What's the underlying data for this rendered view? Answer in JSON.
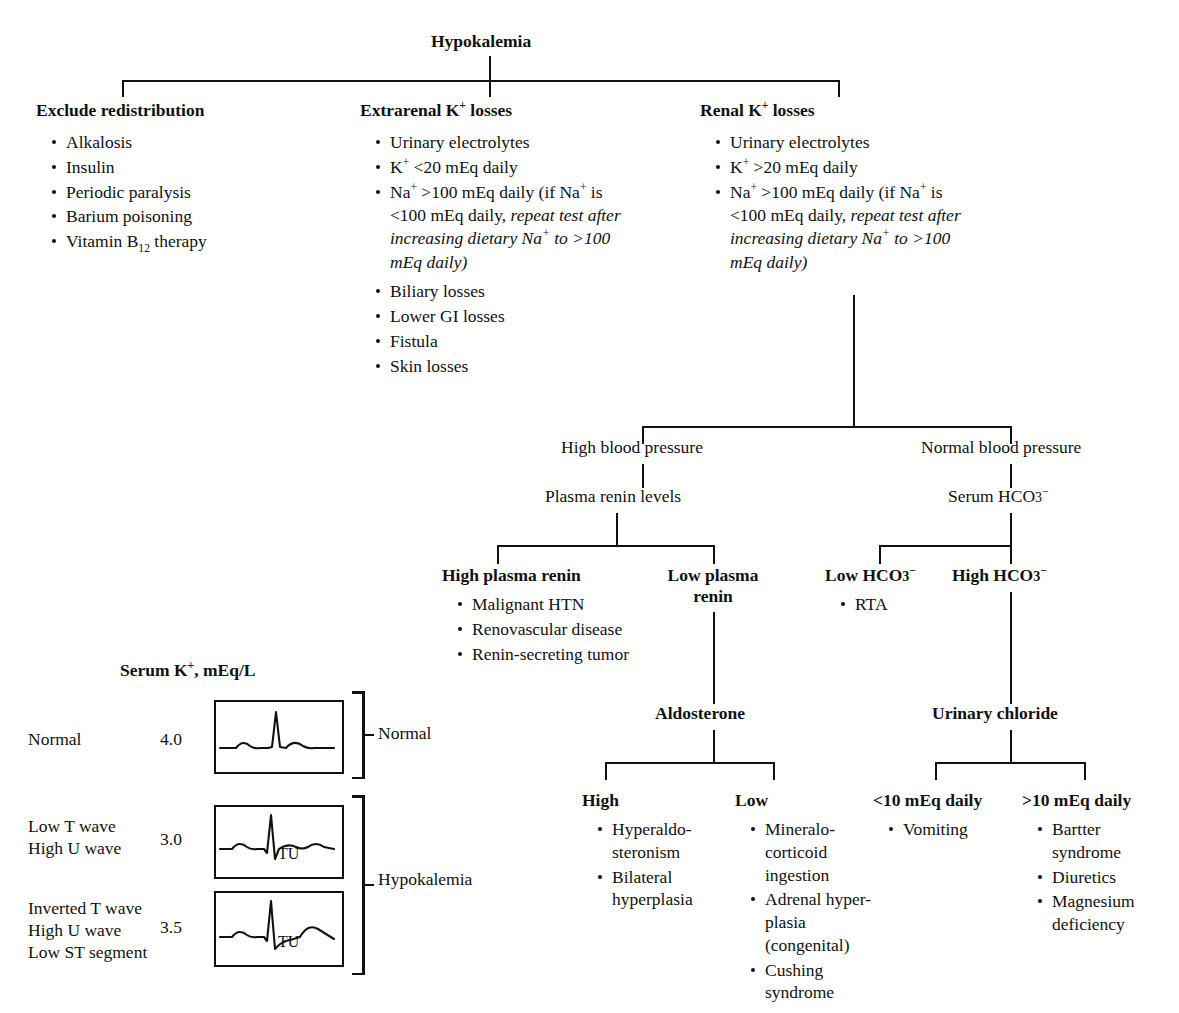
{
  "diagram": {
    "type": "clinical-decision-tree",
    "title": "Hypokalemia",
    "root": {
      "label": "Hypokalemia"
    },
    "level1": [
      {
        "id": "exclude-redistribution",
        "heading": "Exclude redistribution",
        "bullets": [
          "Alkalosis",
          "Insulin",
          "Periodic paralysis",
          "Barium poisoning",
          "Vitamin B12 therapy"
        ]
      },
      {
        "id": "extrarenal-k-losses",
        "heading": "Extrarenal K+ losses",
        "bullets": [
          "Urinary electrolytes",
          "K+ <20 mEq daily",
          "Na+ >100 mEq daily (if Na+ is <100 mEq daily, repeat test after increasing dietary Na+ to >100 mEq daily)",
          "Biliary losses",
          "Lower GI losses",
          "Fistula",
          "Skin losses"
        ]
      },
      {
        "id": "renal-k-losses",
        "heading": "Renal K+ losses",
        "bullets": [
          "Urinary electrolytes",
          "K+ >20 mEq daily",
          "Na+ >100 mEq daily (if Na+ is <100 mEq daily, repeat test after increasing dietary Na+ to >100 mEq daily)"
        ]
      }
    ],
    "branches": {
      "blood_pressure": {
        "high": "High blood pressure",
        "normal": "Normal blood pressure"
      },
      "plasma_renin_levels": "Plasma renin levels",
      "serum_hco3": "Serum HCO3-",
      "renin": {
        "high": {
          "heading": "High plasma renin",
          "bullets": [
            "Malignant HTN",
            "Renovascular disease",
            "Renin-secreting tumor"
          ]
        },
        "low": {
          "heading": "Low plasma renin"
        }
      },
      "hco3": {
        "low": {
          "heading": "Low HCO3-",
          "bullets": [
            "RTA"
          ]
        },
        "high": {
          "heading": "High HCO3-"
        }
      },
      "aldosterone": {
        "label": "Aldosterone",
        "high": {
          "heading": "High",
          "bullets": [
            "Hyperaldo-steronism",
            "Bilateral hyperplasia"
          ]
        },
        "low": {
          "heading": "Low",
          "bullets": [
            "Mineralo-corticoid ingestion",
            "Adrenal hyper-plasia (congenital)",
            "Cushing syndrome"
          ]
        }
      },
      "urinary_chloride": {
        "label": "Urinary chloride",
        "low": {
          "heading": "<10 mEq daily",
          "bullets": [
            "Vomiting"
          ]
        },
        "high": {
          "heading": ">10 mEq daily",
          "bullets": [
            "Bartter syndrome",
            "Diuretics",
            "Magnesium deficiency"
          ]
        }
      }
    },
    "ecg_panel": {
      "title": "Serum K+, mEq/L",
      "rows": [
        {
          "descriptor": "Normal",
          "value": "4.0",
          "trace": "normal",
          "tu_label": ""
        },
        {
          "descriptor": "Low T wave\nHigh U wave",
          "value": "3.0",
          "trace": "low-t-high-u",
          "tu_label": "TU"
        },
        {
          "descriptor": "Inverted T wave\nHigh U wave\nLow ST segment",
          "value": "3.5",
          "trace": "inverted-t",
          "tu_label": "TU"
        }
      ],
      "group_labels": {
        "normal": "Normal",
        "hypokalemia": "Hypokalemia"
      }
    }
  },
  "text": {
    "hypokalemia": "Hypokalemia",
    "exclude_redistribution": "Exclude redistribution",
    "alkalosis": "Alkalosis",
    "insulin": "Insulin",
    "periodic_paralysis": "Periodic paralysis",
    "barium_poisoning": "Barium poisoning",
    "urinary_electrolytes": "Urinary electrolytes",
    "biliary_losses": "Biliary losses",
    "lower_gi_losses": "Lower GI losses",
    "fistula": "Fistula",
    "skin_losses": "Skin losses",
    "high_blood_pressure": "High blood pressure",
    "normal_blood_pressure": "Normal blood pressure",
    "plasma_renin_levels": "Plasma renin levels",
    "high_plasma_renin": "High plasma renin",
    "malignant_htn": "Malignant HTN",
    "renovascular_disease": "Renovascular disease",
    "renin_secreting_tumor": "Renin-secreting tumor",
    "low_plasma": "Low plasma",
    "renin": "renin",
    "rta": "RTA",
    "aldosterone": "Aldosterone",
    "high": "High",
    "low": "Low",
    "hyperaldo": "Hyperaldo-",
    "steronism": "steronism",
    "bilateral": "Bilateral",
    "hyperplasia": "hyperplasia",
    "mineralo": "Mineralo-",
    "corticoid": "corticoid",
    "ingestion": "ingestion",
    "adrenal_hyper": "Adrenal hyper-",
    "plasia_congenital": "plasia (congenital)",
    "cushing_syndrome": "Cushing syndrome",
    "urinary_chloride": "Urinary chloride",
    "lt10": "<10 mEq daily",
    "gt10": ">10 mEq daily",
    "vomiting": "Vomiting",
    "bartter": "Bartter",
    "syndrome": "syndrome",
    "diuretics": "Diuretics",
    "magnesium": "Magnesium",
    "deficiency": "deficiency",
    "ecg_title_a": "Serum K",
    "ecg_title_b": ", mEq/L",
    "normal": "Normal",
    "low_t_wave": "Low T wave",
    "high_u_wave": "High U wave",
    "inverted_t_wave": "Inverted T wave",
    "low_st_segment": "Low ST segment",
    "v40": "4.0",
    "v30": "3.0",
    "v35": "3.5",
    "tu": "TU",
    "hypokalemia_group": "Hypokalemia"
  },
  "colors": {
    "ink": "#111111",
    "paper": "#ffffff"
  }
}
